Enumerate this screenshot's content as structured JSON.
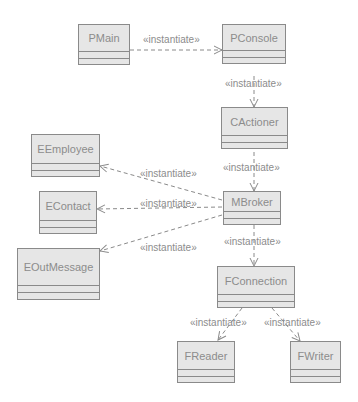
{
  "diagram": {
    "type": "UML class diagram",
    "stereotype": "«instantiate»",
    "classes": [
      {
        "id": "pmain",
        "name": "PMain"
      },
      {
        "id": "pconsole",
        "name": "PConsole"
      },
      {
        "id": "cactioner",
        "name": "CActioner"
      },
      {
        "id": "eemployee",
        "name": "EEmployee"
      },
      {
        "id": "econtact",
        "name": "EContact"
      },
      {
        "id": "eoutmessage",
        "name": "EOutMessage"
      },
      {
        "id": "mbroker",
        "name": "MBroker"
      },
      {
        "id": "fconnection",
        "name": "FConnection"
      },
      {
        "id": "freader",
        "name": "FReader"
      },
      {
        "id": "fwriter",
        "name": "FWriter"
      }
    ],
    "dependencies": [
      {
        "from": "PMain",
        "to": "PConsole",
        "label": "«instantiate»"
      },
      {
        "from": "PConsole",
        "to": "CActioner",
        "label": "«instantiate»"
      },
      {
        "from": "CActioner",
        "to": "MBroker",
        "label": "«instantiate»"
      },
      {
        "from": "MBroker",
        "to": "EEmployee",
        "label": "«instantiate»"
      },
      {
        "from": "MBroker",
        "to": "EContact",
        "label": "«instantiate»"
      },
      {
        "from": "MBroker",
        "to": "EOutMessage",
        "label": "«instantiate»"
      },
      {
        "from": "MBroker",
        "to": "FConnection",
        "label": "«instantiate»"
      },
      {
        "from": "FConnection",
        "to": "FReader",
        "label": "«instantiate»"
      },
      {
        "from": "FConnection",
        "to": "FWriter",
        "label": "«instantiate»"
      }
    ]
  }
}
